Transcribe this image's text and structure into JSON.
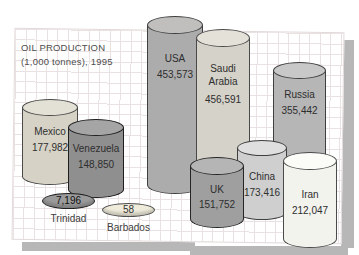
{
  "title": {
    "line1": "OIL PRODUCTION",
    "line2": "(1,000 tonnes), 1995"
  },
  "chart_data": {
    "type": "bar",
    "style": "3d-cylinder pictogram, no axes, values labeled on each cylinder",
    "title": "OIL PRODUCTION (1,000 tonnes), 1995",
    "unit": "1,000 tonnes",
    "year": "1995",
    "categories": [
      "USA",
      "Saudi Arabia",
      "Russia",
      "Iran",
      "Mexico",
      "China",
      "UK",
      "Venezuela",
      "Trinidad",
      "Barbados"
    ],
    "values": [
      453573,
      456591,
      355442,
      212047,
      177982,
      173416,
      151752,
      148850,
      7196,
      58
    ],
    "legend": "none",
    "grid": "faint graph-paper grid behind cylinders",
    "background_colors": {
      "paper": "#ffffff",
      "drop_shadow": "#b7b7b7",
      "grid_line": "#eae2e2"
    }
  },
  "countries": [
    {
      "id": "russia",
      "type": "cylinder",
      "label": [
        "Russia"
      ],
      "value": "355,442",
      "x": 273,
      "yTop": 70,
      "w": 53,
      "ry": 8.5,
      "yBot": 168,
      "z": 1,
      "body": "#b6b6b6",
      "top": "#c8c8c8",
      "stroke": "#3f3f3f",
      "labelY": 88,
      "valueGap": 3
    },
    {
      "id": "usa",
      "type": "cylinder",
      "label": [
        "USA"
      ],
      "value": "453,573",
      "x": 147,
      "yTop": 25,
      "w": 56,
      "ry": 9,
      "yBot": 185,
      "z": 2,
      "body": "#acacac",
      "top": "#c0bfbd",
      "stroke": "#3f3f3f",
      "labelY": 52,
      "valueGap": 3
    },
    {
      "id": "saudi-arabia",
      "type": "cylinder",
      "label": [
        "Saudi",
        "Arabia"
      ],
      "value": "456,591",
      "x": 196,
      "yTop": 38,
      "w": 54,
      "ry": 9,
      "yBot": 208,
      "z": 3,
      "body": "#d5d2c9",
      "top": "#e4e1d8",
      "stroke": "#4a4a4a",
      "labelY": 62,
      "valueGap": 5
    },
    {
      "id": "china",
      "type": "cylinder",
      "label": [
        "China"
      ],
      "value": "173,416",
      "x": 237,
      "yTop": 148,
      "w": 50,
      "ry": 8,
      "yBot": 212,
      "z": 4,
      "body": "#cfcfcf",
      "top": "#dfdfdf",
      "stroke": "#3f3f3f",
      "labelY": 170,
      "valueGap": 3
    },
    {
      "id": "uk",
      "type": "cylinder",
      "label": [
        "UK"
      ],
      "value": "151,752",
      "x": 190,
      "yTop": 166,
      "w": 54,
      "ry": 9,
      "yBot": 219,
      "z": 5,
      "body": "#9f9f9f",
      "top": "#b5b5b5",
      "stroke": "#262626",
      "labelY": 183,
      "valueGap": 2
    },
    {
      "id": "iran",
      "type": "cylinder",
      "label": [
        "Iran"
      ],
      "value": "212,047",
      "x": 283,
      "yTop": 161,
      "w": 54,
      "ry": 9,
      "yBot": 239,
      "z": 6,
      "body": "#f3f3ee",
      "top": "#fbfbf8",
      "stroke": "#4a4a4a",
      "labelY": 188,
      "valueGap": 3
    },
    {
      "id": "mexico",
      "type": "cylinder",
      "label": [
        "Mexico"
      ],
      "value": "177,982",
      "x": 22,
      "yTop": 107,
      "w": 56,
      "ry": 8.5,
      "yBot": 176,
      "z": 7,
      "body": "#d6d3c6",
      "top": "#e3e0d5",
      "stroke": "#4a4a4a",
      "labelY": 125,
      "valueGap": 3
    },
    {
      "id": "venezuela",
      "type": "cylinder",
      "label": [
        "Venezuela"
      ],
      "value": "148,850",
      "x": 68,
      "yTop": 127,
      "w": 56,
      "ry": 8.5,
      "yBot": 189,
      "z": 8,
      "body": "#8f8f8f",
      "top": "#a5a5a5",
      "stroke": "#1f1f1f",
      "labelY": 142,
      "valueGap": 3
    },
    {
      "id": "trinidad",
      "type": "disc",
      "value": "7,196",
      "belowLabel": "Trinidad",
      "x": 42,
      "y": 193,
      "w": 53,
      "h": 16,
      "z": 9,
      "body": "#9b9b9b",
      "stroke": "#1f1f1f",
      "textColor": "#111111",
      "belowY": 213
    },
    {
      "id": "barbados",
      "type": "disc",
      "value": "58",
      "belowLabel": "Barbados",
      "x": 102,
      "y": 203,
      "w": 53,
      "h": 14,
      "z": 10,
      "body": "#f0ecdc",
      "stroke": "#4f4f4f",
      "textColor": "#333333",
      "belowY": 222
    }
  ]
}
